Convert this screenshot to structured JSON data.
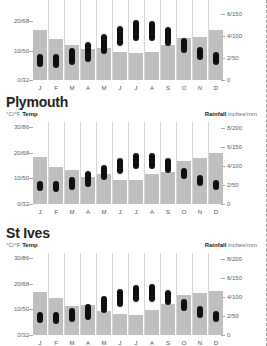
{
  "page": {
    "background_color": "#ffffff",
    "bar_color": "#bfbfbf",
    "capsule_color": "#100f0f",
    "gridline_color": "#d6d6d6",
    "axis_text_color": "#5e5e5e"
  },
  "captions": {
    "temp_units": "°C/°F ",
    "temp_label": "Temp",
    "rain_label": "Rainfall",
    "rain_units": " inches/mm"
  },
  "axes": {
    "left_ticks": [
      "30/86",
      "20/68",
      "10/50",
      "0/32"
    ],
    "left_values": [
      30,
      20,
      10,
      0
    ],
    "left_min": 0,
    "left_max": 32,
    "right_ticks": [
      "8/200",
      "6/150",
      "4/100",
      "2/50",
      "0"
    ],
    "right_values": [
      200,
      150,
      100,
      50,
      0
    ],
    "right_min": 0,
    "right_max": 215,
    "months": [
      "J",
      "F",
      "M",
      "A",
      "M",
      "J",
      "J",
      "A",
      "S",
      "O",
      "N",
      "D"
    ]
  },
  "charts": [
    {
      "id": "chart-top",
      "title": "",
      "title_visible": false,
      "rainfall_mm": [
        115,
        93,
        80,
        72,
        73,
        63,
        62,
        63,
        80,
        95,
        98,
        115
      ],
      "temp_min_c": [
        4.5,
        4.2,
        5.2,
        6.2,
        8.8,
        11.5,
        13.2,
        13.2,
        11.5,
        9.2,
        6.8,
        5.0
      ],
      "temp_max_c": [
        9.0,
        9.0,
        10.8,
        12.8,
        15.8,
        18.5,
        20.4,
        20.2,
        18.0,
        14.4,
        11.2,
        9.4
      ]
    },
    {
      "id": "chart-plymouth",
      "title": "Plymouth",
      "title_visible": true,
      "rainfall_mm": [
        122,
        97,
        88,
        72,
        80,
        63,
        62,
        80,
        85,
        112,
        120,
        133
      ],
      "temp_min_c": [
        5.0,
        4.8,
        5.6,
        6.8,
        9.2,
        11.8,
        13.5,
        13.6,
        12.0,
        9.8,
        7.2,
        5.6
      ],
      "temp_max_c": [
        8.8,
        8.8,
        10.5,
        12.8,
        15.4,
        18.0,
        19.8,
        19.8,
        17.8,
        14.2,
        11.2,
        9.2
      ]
    },
    {
      "id": "chart-st-ives",
      "title": "St Ives",
      "title_visible": true,
      "rainfall_mm": [
        112,
        98,
        76,
        78,
        64,
        56,
        53,
        66,
        82,
        105,
        110,
        115
      ],
      "temp_min_c": [
        4.6,
        4.4,
        5.2,
        6.0,
        8.4,
        11.0,
        12.8,
        13.0,
        11.6,
        9.4,
        6.8,
        5.2
      ],
      "temp_max_c": [
        9.0,
        8.8,
        10.4,
        12.2,
        15.2,
        17.8,
        19.6,
        19.8,
        17.6,
        14.2,
        11.4,
        9.4
      ]
    }
  ],
  "chart_data": {
    "type": "bar",
    "xlabel": "",
    "ylabel": "°C/°F Temp",
    "y2label": "Rainfall inches/mm",
    "grid": true,
    "legend": "none",
    "categories": [
      "J",
      "F",
      "M",
      "A",
      "M",
      "J",
      "J",
      "A",
      "S",
      "O",
      "N",
      "D"
    ],
    "ylim": [
      0,
      32
    ],
    "y2lim": [
      0,
      215
    ],
    "yticks": [
      0,
      10,
      20,
      30
    ],
    "ytick_labels": [
      "0/32",
      "10/50",
      "20/68",
      "30/86"
    ],
    "y2ticks": [
      0,
      50,
      100,
      150,
      200
    ],
    "y2tick_labels": [
      "0",
      "2/50",
      "4/100",
      "6/150",
      "8/200"
    ],
    "panels": [
      {
        "name": "",
        "series": [
          {
            "name": "Rainfall (mm)",
            "axis": "right",
            "kind": "bar",
            "values": [
              115,
              93,
              80,
              72,
              73,
              63,
              62,
              63,
              80,
              95,
              98,
              115
            ]
          },
          {
            "name": "Temp min (°C)",
            "axis": "left",
            "kind": "range-low",
            "values": [
              4.5,
              4.2,
              5.2,
              6.2,
              8.8,
              11.5,
              13.2,
              13.2,
              11.5,
              9.2,
              6.8,
              5.0
            ]
          },
          {
            "name": "Temp max (°C)",
            "axis": "left",
            "kind": "range-high",
            "values": [
              9.0,
              9.0,
              10.8,
              12.8,
              15.8,
              18.5,
              20.4,
              20.2,
              18.0,
              14.4,
              11.2,
              9.4
            ]
          }
        ]
      },
      {
        "name": "Plymouth",
        "series": [
          {
            "name": "Rainfall (mm)",
            "axis": "right",
            "kind": "bar",
            "values": [
              122,
              97,
              88,
              72,
              80,
              63,
              62,
              80,
              85,
              112,
              120,
              133
            ]
          },
          {
            "name": "Temp min (°C)",
            "axis": "left",
            "kind": "range-low",
            "values": [
              5.0,
              4.8,
              5.6,
              6.8,
              9.2,
              11.8,
              13.5,
              13.6,
              12.0,
              9.8,
              7.2,
              5.6
            ]
          },
          {
            "name": "Temp max (°C)",
            "axis": "left",
            "kind": "range-high",
            "values": [
              8.8,
              8.8,
              10.5,
              12.8,
              15.4,
              18.0,
              19.8,
              19.8,
              17.8,
              14.2,
              11.2,
              9.2
            ]
          }
        ]
      },
      {
        "name": "St Ives",
        "series": [
          {
            "name": "Rainfall (mm)",
            "axis": "right",
            "kind": "bar",
            "values": [
              112,
              98,
              76,
              78,
              64,
              56,
              53,
              66,
              82,
              105,
              110,
              115
            ]
          },
          {
            "name": "Temp min (°C)",
            "axis": "left",
            "kind": "range-low",
            "values": [
              4.6,
              4.4,
              5.2,
              6.0,
              8.4,
              11.0,
              12.8,
              13.0,
              11.6,
              9.4,
              6.8,
              5.2
            ]
          },
          {
            "name": "Temp max (°C)",
            "axis": "left",
            "kind": "range-high",
            "values": [
              9.0,
              8.8,
              10.4,
              12.2,
              15.2,
              17.8,
              19.6,
              19.8,
              17.6,
              14.2,
              11.4,
              9.4
            ]
          }
        ]
      }
    ]
  },
  "layout": {
    "panel_plot_heights": [
      78,
      80,
      80
    ],
    "panel_tops": [
      0,
      94,
      225
    ]
  }
}
